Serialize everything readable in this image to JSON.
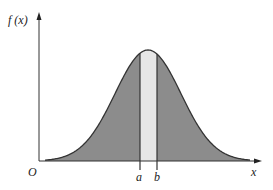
{
  "diagram": {
    "type": "probability-density-curve",
    "y_axis_label": "f (x)",
    "x_axis_label": "x",
    "origin_label": "O",
    "interval_labels": [
      "a",
      "b"
    ],
    "colors": {
      "fill": "#8c8c8c",
      "highlight": "#e6e6e6",
      "stroke": "#333333"
    }
  }
}
